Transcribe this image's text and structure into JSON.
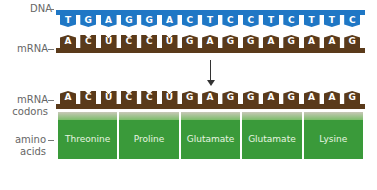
{
  "labels": {
    "dna": "DNA",
    "mrna_top": "mRNA",
    "mrna_codons_line1": "mRNA",
    "mrna_codons_line2": "codons",
    "amino_line1": "amino",
    "amino_line2": "acids"
  },
  "dna_bases": [
    "T",
    "G",
    "A",
    "G",
    "G",
    "A",
    "C",
    "T",
    "C",
    "C",
    "T",
    "C",
    "T",
    "T",
    "C"
  ],
  "mrna_bases": [
    "A",
    "C",
    "U",
    "C",
    "C",
    "U",
    "G",
    "A",
    "G",
    "G",
    "A",
    "G",
    "A",
    "A",
    "G"
  ],
  "amino_acids": [
    "Threonine",
    "Proline",
    "Glutamate",
    "Glutamate",
    "Lysine"
  ],
  "colors": {
    "dna": "#1f77c5",
    "mrna": "#5a3a1a",
    "amino": "#3a9a3a"
  }
}
